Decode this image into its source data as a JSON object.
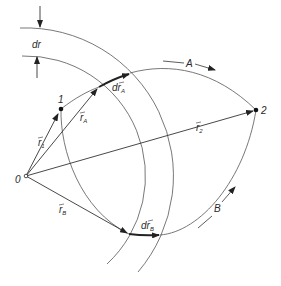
{
  "diagram": {
    "points": [
      {
        "id": "origin",
        "label": "0"
      },
      {
        "id": "p1",
        "label": "1"
      },
      {
        "id": "p2",
        "label": "2"
      }
    ],
    "vectors": {
      "r1": {
        "base": "r",
        "sub": "1"
      },
      "r2": {
        "base": "r",
        "sub": "2"
      },
      "rA": {
        "base": "r",
        "sub": "A"
      },
      "rB": {
        "base": "r",
        "sub": "B"
      },
      "drA": {
        "prefix": "d",
        "base": "r",
        "sub": "A"
      },
      "drB": {
        "prefix": "d",
        "base": "r",
        "sub": "B"
      }
    },
    "paths": [
      {
        "id": "A",
        "label": "A"
      },
      {
        "id": "B",
        "label": "B"
      }
    ],
    "shell_width_label": "dr",
    "colors": {
      "ink": "#2a2a2a",
      "background": "#ffffff"
    }
  }
}
